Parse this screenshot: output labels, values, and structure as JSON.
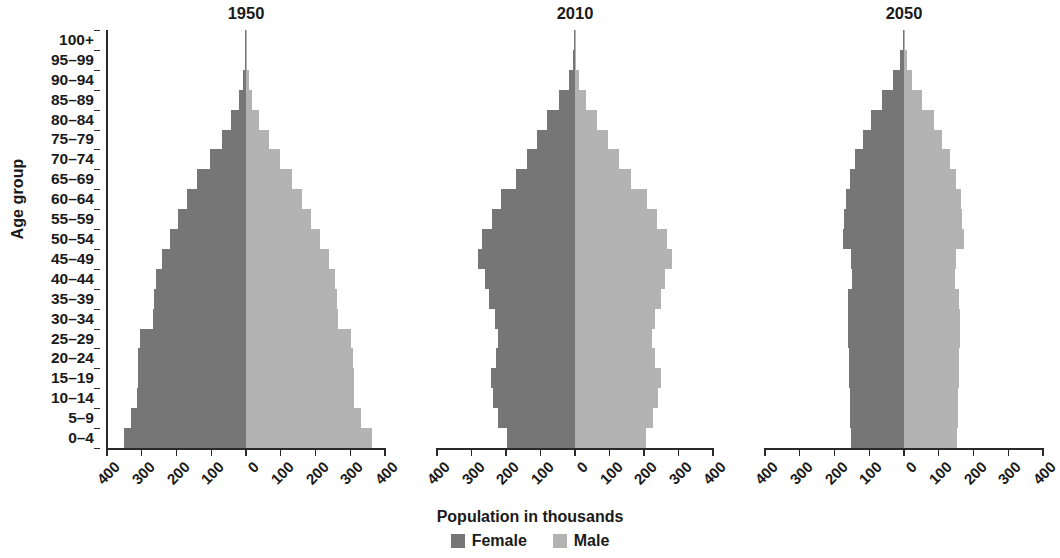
{
  "chart_data": {
    "type": "bar",
    "subtype": "population-pyramid",
    "title": "",
    "xlabel": "Population in thousands",
    "ylabel": "Age group",
    "xlim": [
      -400,
      400
    ],
    "xticks": [
      "400",
      "300",
      "200",
      "100",
      "0",
      "100",
      "200",
      "300",
      "400"
    ],
    "xtick_values": [
      400,
      300,
      200,
      100,
      0,
      100,
      200,
      300,
      400
    ],
    "grid": false,
    "legend_position": "bottom",
    "legend": [
      {
        "name": "Female",
        "color": "#767676",
        "side": "left"
      },
      {
        "name": "Male",
        "color": "#b3b3b3",
        "side": "right"
      }
    ],
    "categories": [
      "100+",
      "95–99",
      "90–94",
      "85–89",
      "80–84",
      "75–79",
      "70–74",
      "65–69",
      "60–64",
      "55–59",
      "50–54",
      "45–49",
      "40–44",
      "35–39",
      "30–34",
      "25–29",
      "20–24",
      "15–19",
      "10–14",
      "5–9",
      "0–4"
    ],
    "panels": [
      {
        "title": "1950",
        "female": [
          1,
          3,
          8,
          20,
          42,
          70,
          105,
          140,
          170,
          195,
          218,
          243,
          258,
          265,
          268,
          305,
          310,
          312,
          313,
          330,
          352
        ],
        "male": [
          1,
          3,
          8,
          18,
          38,
          65,
          98,
          132,
          162,
          188,
          212,
          238,
          255,
          262,
          265,
          302,
          308,
          310,
          312,
          330,
          362
        ]
      },
      {
        "title": "2010",
        "female": [
          1,
          6,
          18,
          45,
          80,
          110,
          140,
          170,
          215,
          240,
          270,
          282,
          262,
          248,
          232,
          222,
          230,
          244,
          238,
          222,
          198
        ],
        "male": [
          1,
          4,
          12,
          33,
          63,
          95,
          128,
          162,
          210,
          238,
          268,
          282,
          262,
          248,
          232,
          222,
          232,
          248,
          242,
          226,
          205
        ]
      },
      {
        "title": "2050",
        "female": [
          3,
          12,
          32,
          62,
          95,
          118,
          140,
          155,
          168,
          172,
          175,
          152,
          150,
          160,
          162,
          162,
          158,
          158,
          156,
          155,
          152
        ],
        "male": [
          2,
          8,
          24,
          52,
          85,
          110,
          133,
          150,
          163,
          168,
          172,
          150,
          148,
          158,
          160,
          160,
          157,
          157,
          155,
          154,
          152
        ]
      }
    ]
  },
  "axis": {
    "y_title": "Age group",
    "x_title": "Population in thousands"
  },
  "legend": {
    "female_label": "Female",
    "male_label": "Male"
  }
}
